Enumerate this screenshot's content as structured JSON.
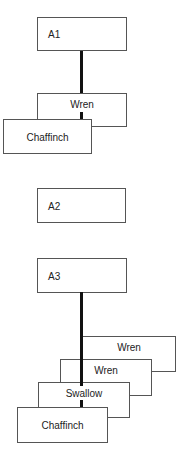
{
  "diagram": {
    "groups": [
      {
        "id": "A1",
        "label": "A1",
        "stack": [
          "Wren",
          "Chaffinch"
        ]
      },
      {
        "id": "A2",
        "label": "A2",
        "stack": []
      },
      {
        "id": "A3",
        "label": "A3",
        "stack": [
          "Wren",
          "Wren",
          "Swallow",
          "Chaffinch"
        ]
      }
    ]
  }
}
